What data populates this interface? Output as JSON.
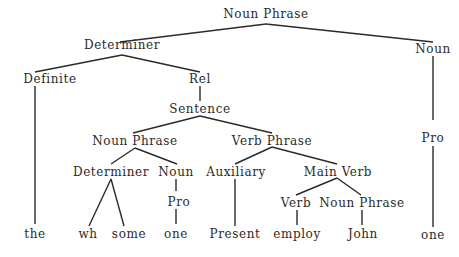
{
  "diagram": {
    "type": "syntax-tree",
    "nodes": {
      "root_np": {
        "label": "Noun Phrase",
        "x": 266,
        "y": 7
      },
      "det": {
        "label": "Determiner",
        "x": 122,
        "y": 38
      },
      "noun_r": {
        "label": "Noun",
        "x": 433,
        "y": 42
      },
      "definite": {
        "label": "Definite",
        "x": 50,
        "y": 72
      },
      "rel": {
        "label": "Rel",
        "x": 200,
        "y": 72
      },
      "sentence": {
        "label": "Sentence",
        "x": 200,
        "y": 102
      },
      "np_inner": {
        "label": "Noun Phrase",
        "x": 135,
        "y": 134
      },
      "vp": {
        "label": "Verb Phrase",
        "x": 272,
        "y": 134
      },
      "det_inner": {
        "label": "Determiner",
        "x": 111,
        "y": 165
      },
      "noun_inner": {
        "label": "Noun",
        "x": 176,
        "y": 165
      },
      "pro_inner": {
        "label": "Pro",
        "x": 179,
        "y": 195
      },
      "aux": {
        "label": "Auxiliary",
        "x": 236,
        "y": 165
      },
      "main_verb": {
        "label": "Main Verb",
        "x": 338,
        "y": 165
      },
      "verb": {
        "label": "Verb",
        "x": 296,
        "y": 196
      },
      "np_mv": {
        "label": "Noun Phrase",
        "x": 362,
        "y": 196
      },
      "pro_r": {
        "label": "Pro",
        "x": 433,
        "y": 131
      },
      "leaf_the": {
        "label": "the",
        "x": 35,
        "y": 227
      },
      "leaf_wh": {
        "label": "wh",
        "x": 88,
        "y": 227
      },
      "leaf_some": {
        "label": "some",
        "x": 129,
        "y": 227
      },
      "leaf_one1": {
        "label": "one",
        "x": 176,
        "y": 227
      },
      "leaf_present": {
        "label": "Present",
        "x": 235,
        "y": 227
      },
      "leaf_employ": {
        "label": "employ",
        "x": 297,
        "y": 227
      },
      "leaf_john": {
        "label": "John",
        "x": 363,
        "y": 227
      },
      "leaf_one2": {
        "label": "one",
        "x": 433,
        "y": 228
      }
    },
    "edges": [
      {
        "from": "root_np",
        "to": "det",
        "x1": 266,
        "y1": 24,
        "x2": 120,
        "y2": 42
      },
      {
        "from": "root_np",
        "to": "noun_r",
        "x1": 266,
        "y1": 24,
        "x2": 433,
        "y2": 42
      },
      {
        "from": "det",
        "to": "definite",
        "x1": 122,
        "y1": 55,
        "x2": 35,
        "y2": 72
      },
      {
        "from": "det",
        "to": "rel",
        "x1": 122,
        "y1": 55,
        "x2": 200,
        "y2": 72
      },
      {
        "from": "definite",
        "to": "the",
        "x1": 35,
        "y1": 86,
        "x2": 35,
        "y2": 224
      },
      {
        "from": "rel",
        "to": "sentence",
        "x1": 200,
        "y1": 86,
        "x2": 200,
        "y2": 101
      },
      {
        "from": "sentence",
        "to": "np_inner",
        "x1": 200,
        "y1": 116,
        "x2": 133,
        "y2": 133
      },
      {
        "from": "sentence",
        "to": "vp",
        "x1": 200,
        "y1": 116,
        "x2": 272,
        "y2": 133
      },
      {
        "from": "np_inner",
        "to": "det_inner",
        "x1": 135,
        "y1": 148,
        "x2": 111,
        "y2": 164
      },
      {
        "from": "np_inner",
        "to": "noun_inner",
        "x1": 135,
        "y1": 148,
        "x2": 177,
        "y2": 164
      },
      {
        "from": "det_inner",
        "to": "wh",
        "x1": 111,
        "y1": 179,
        "x2": 89,
        "y2": 226
      },
      {
        "from": "det_inner",
        "to": "some",
        "x1": 111,
        "y1": 179,
        "x2": 124,
        "y2": 226
      },
      {
        "from": "noun_inner",
        "to": "pro_inner",
        "x1": 176,
        "y1": 179,
        "x2": 176,
        "y2": 191
      },
      {
        "from": "pro_inner",
        "to": "one1",
        "x1": 176,
        "y1": 209,
        "x2": 176,
        "y2": 224
      },
      {
        "from": "vp",
        "to": "aux",
        "x1": 272,
        "y1": 147,
        "x2": 235,
        "y2": 164
      },
      {
        "from": "vp",
        "to": "main_verb",
        "x1": 272,
        "y1": 147,
        "x2": 337,
        "y2": 164
      },
      {
        "from": "aux",
        "to": "present",
        "x1": 235,
        "y1": 179,
        "x2": 235,
        "y2": 226
      },
      {
        "from": "main_verb",
        "to": "verb",
        "x1": 337,
        "y1": 178,
        "x2": 296,
        "y2": 195
      },
      {
        "from": "main_verb",
        "to": "np_mv",
        "x1": 337,
        "y1": 178,
        "x2": 361,
        "y2": 195
      },
      {
        "from": "verb",
        "to": "employ",
        "x1": 297,
        "y1": 210,
        "x2": 297,
        "y2": 225
      },
      {
        "from": "np_mv",
        "to": "john",
        "x1": 362,
        "y1": 210,
        "x2": 362,
        "y2": 225
      },
      {
        "from": "noun_r",
        "to": "pro_r",
        "x1": 433,
        "y1": 56,
        "x2": 433,
        "y2": 120
      },
      {
        "from": "pro_r",
        "to": "one2",
        "x1": 433,
        "y1": 146,
        "x2": 433,
        "y2": 227
      }
    ]
  }
}
